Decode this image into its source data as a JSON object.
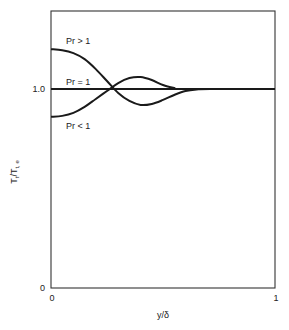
{
  "chart_data": {
    "type": "line",
    "title": "",
    "xlabel": "y/δ",
    "ylabel_main": "T",
    "ylabel_sub": "t",
    "ylabel_den": "/T",
    "ylabel_den_sub": "t, e",
    "xlim": [
      0,
      1
    ],
    "ylim": [
      0,
      1.45
    ],
    "grid": false,
    "x_ticks": [
      {
        "value": 0,
        "label": "0"
      },
      {
        "value": 1,
        "label": "1"
      }
    ],
    "y_ticks": [
      {
        "value": 0,
        "label": "0"
      },
      {
        "value": 1.0,
        "label": "1.0"
      }
    ],
    "series": [
      {
        "name": "Pr > 1",
        "label": "Pr > 1",
        "points": [
          [
            0,
            1.2
          ],
          [
            0.05,
            1.195
          ],
          [
            0.1,
            1.18
          ],
          [
            0.15,
            1.15
          ],
          [
            0.2,
            1.1
          ],
          [
            0.25,
            1.04
          ],
          [
            0.3,
            0.98
          ],
          [
            0.35,
            0.94
          ],
          [
            0.4,
            0.92
          ],
          [
            0.45,
            0.925
          ],
          [
            0.5,
            0.945
          ],
          [
            0.55,
            0.97
          ],
          [
            0.6,
            0.99
          ],
          [
            0.65,
            0.998
          ],
          [
            0.71,
            1.0
          ],
          [
            1.0,
            1.0
          ]
        ]
      },
      {
        "name": "Pr = 1",
        "label": "Pr = 1",
        "points": [
          [
            0,
            1.0
          ],
          [
            1.0,
            1.0
          ]
        ]
      },
      {
        "name": "Pr < 1",
        "label": "Pr < 1",
        "points": [
          [
            0,
            0.86
          ],
          [
            0.05,
            0.865
          ],
          [
            0.1,
            0.88
          ],
          [
            0.15,
            0.91
          ],
          [
            0.2,
            0.95
          ],
          [
            0.25,
            0.99
          ],
          [
            0.3,
            1.03
          ],
          [
            0.35,
            1.055
          ],
          [
            0.4,
            1.06
          ],
          [
            0.45,
            1.045
          ],
          [
            0.5,
            1.02
          ],
          [
            0.55,
            1.005
          ],
          [
            0.58,
            1.0
          ],
          [
            1.0,
            1.0
          ]
        ]
      }
    ]
  }
}
